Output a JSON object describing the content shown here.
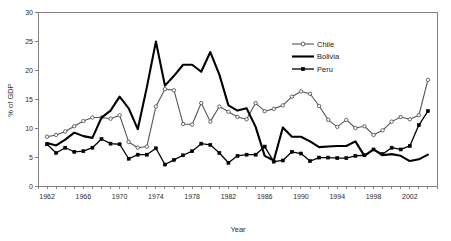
{
  "chart_data": {
    "type": "line",
    "title": "",
    "xlabel": "Year",
    "ylabel": "% of GDP",
    "xlim": [
      1961,
      2005
    ],
    "ylim": [
      0,
      30
    ],
    "ytick_step": 5,
    "xtick_step_labeled": 4,
    "xtick_step_minor": 1,
    "grid": false,
    "legend_position": "top-right-inside",
    "y_ticks": [
      "0",
      "5",
      "10",
      "15",
      "20",
      "25",
      "30"
    ],
    "x_ticks": [
      "1962",
      "1966",
      "1970",
      "1974",
      "1978",
      "1982",
      "1986",
      "1990",
      "1994",
      "1998",
      "2002"
    ],
    "x": [
      1962,
      1963,
      1964,
      1965,
      1966,
      1967,
      1968,
      1969,
      1970,
      1971,
      1972,
      1973,
      1974,
      1975,
      1976,
      1977,
      1978,
      1979,
      1980,
      1981,
      1982,
      1983,
      1984,
      1985,
      1986,
      1987,
      1988,
      1989,
      1990,
      1991,
      1992,
      1993,
      1994,
      1995,
      1996,
      1997,
      1998,
      1999,
      2000,
      2001,
      2002,
      2003,
      2004
    ],
    "series": [
      {
        "name": "Chile",
        "marker": "open-circle",
        "color": "#555555",
        "values": [
          8.5,
          8.8,
          9.4,
          10.3,
          11.2,
          11.8,
          11.8,
          11.6,
          12.2,
          7.6,
          6.6,
          6.8,
          13.7,
          16.7,
          16.5,
          10.7,
          10.6,
          14.3,
          11.1,
          13.7,
          12.8,
          11.9,
          11.5,
          14.3,
          12.9,
          13.3,
          13.9,
          15.4,
          16.3,
          15.9,
          13.8,
          11.4,
          10.2,
          11.4,
          10.0,
          10.3,
          8.8,
          9.6,
          11.1,
          11.9,
          11.5,
          12.2,
          18.3
        ]
      },
      {
        "name": "Bolivia",
        "marker": "none",
        "color": "#000000",
        "values": [
          7.4,
          7.0,
          8.0,
          9.2,
          8.6,
          8.3,
          11.8,
          13.0,
          15.4,
          13.4,
          9.8,
          17.0,
          24.9,
          17.3,
          19.0,
          20.9,
          20.9,
          19.7,
          23.1,
          19.2,
          13.9,
          13.0,
          13.4,
          10.2,
          5.2,
          4.4,
          10.1,
          8.5,
          8.5,
          7.7,
          6.7,
          6.8,
          6.9,
          6.9,
          7.7,
          5.2,
          6.3,
          5.3,
          5.5,
          5.2,
          4.3,
          4.6,
          5.4
        ]
      },
      {
        "name": "Peru",
        "marker": "filled-square",
        "color": "#000000",
        "values": [
          7.2,
          5.7,
          6.6,
          5.9,
          6.0,
          6.6,
          8.1,
          7.3,
          7.2,
          4.7,
          5.4,
          5.4,
          6.5,
          3.7,
          4.5,
          5.3,
          6.0,
          7.3,
          7.1,
          5.7,
          4.0,
          5.2,
          5.4,
          5.4,
          6.8,
          4.2,
          4.4,
          5.9,
          5.6,
          4.3,
          4.9,
          4.9,
          4.8,
          4.8,
          5.2,
          5.3,
          6.3,
          5.5,
          6.6,
          6.3,
          6.9,
          10.5,
          12.9
        ]
      }
    ],
    "legend": [
      {
        "label": "Chile",
        "marker": "open-circle"
      },
      {
        "label": "Bolivia",
        "marker": "none"
      },
      {
        "label": "Peru",
        "marker": "filled-square"
      }
    ]
  }
}
